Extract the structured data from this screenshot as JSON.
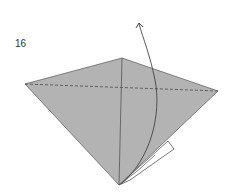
{
  "diagram": {
    "step_number": "16",
    "colors": {
      "paper": "#b0b0b0",
      "edge": "#555555",
      "arrow": "#444444",
      "flap": "#ffffff"
    }
  }
}
